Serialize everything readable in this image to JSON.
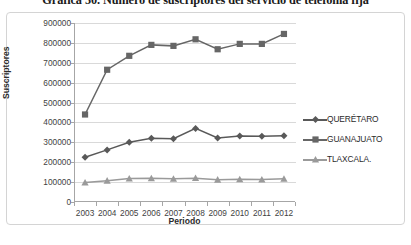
{
  "title": "Gráfica 50. Número de suscriptores del servicio de telefonía fija",
  "axis": {
    "y_title": "Suscriptores",
    "x_title": "Periodo"
  },
  "legend": {
    "items": [
      {
        "label": "QUERÉTARO",
        "marker": "diamond-marker",
        "color": "#595959"
      },
      {
        "label": "GUANAJUATO",
        "marker": "square-marker",
        "color": "#666666"
      },
      {
        "label": "TLAXCALA.",
        "marker": "triangle-marker",
        "color": "#9a9a9a"
      }
    ]
  },
  "chart_data": {
    "type": "line",
    "title": "Gráfica 50. Número de suscriptores del servicio de telefonía fija",
    "xlabel": "Periodo",
    "ylabel": "Suscriptores",
    "categories": [
      "2003",
      "2004",
      "2005",
      "2006",
      "2007",
      "2008",
      "2009",
      "2010",
      "2011",
      "2012"
    ],
    "ylim": [
      0,
      900000
    ],
    "ytick_labels": [
      "0",
      "100000",
      "200000",
      "300000",
      "400000",
      "500000",
      "600000",
      "700000",
      "800000",
      "900000"
    ],
    "ytick_values": [
      0,
      100000,
      200000,
      300000,
      400000,
      500000,
      600000,
      700000,
      800000,
      900000
    ],
    "grid": true,
    "legend_position": "right",
    "series": [
      {
        "name": "QUERÉTARO",
        "marker": "diamond",
        "color": "#595959",
        "values": [
          225000,
          262000,
          300000,
          320000,
          318000,
          370000,
          322000,
          332000,
          330000,
          333000
        ]
      },
      {
        "name": "GUANAJUATO",
        "marker": "square",
        "color": "#666666",
        "values": [
          440000,
          665000,
          735000,
          790000,
          785000,
          818000,
          768000,
          795000,
          795000,
          845000
        ]
      },
      {
        "name": "TLAXCALA.",
        "marker": "triangle",
        "color": "#9a9a9a",
        "values": [
          98000,
          107000,
          118000,
          119000,
          117000,
          120000,
          112000,
          114000,
          113000,
          117000
        ]
      }
    ]
  }
}
